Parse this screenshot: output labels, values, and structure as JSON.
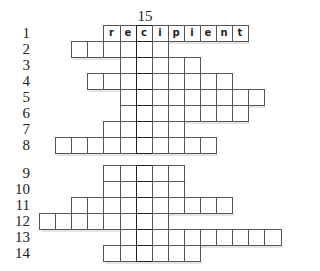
{
  "puzzle": {
    "key_column_label": "15",
    "key_column": 6,
    "origin_x": 39,
    "cell_size": 16.1,
    "rows": [
      {
        "label": "1",
        "top": 25,
        "start": 4,
        "end": 12,
        "letters": [
          "r",
          "e",
          "c",
          "i",
          "p",
          "i",
          "e",
          "n",
          "t"
        ]
      },
      {
        "label": "2",
        "top": 41,
        "start": 2,
        "end": 7
      },
      {
        "label": "3",
        "top": 57,
        "start": 5,
        "end": 9
      },
      {
        "label": "4",
        "top": 73,
        "start": 3,
        "end": 11
      },
      {
        "label": "5",
        "top": 89,
        "start": 5,
        "end": 13
      },
      {
        "label": "6",
        "top": 105,
        "start": 5,
        "end": 12
      },
      {
        "label": "7",
        "top": 121,
        "start": 4,
        "end": 8
      },
      {
        "label": "8",
        "top": 137,
        "start": 1,
        "end": 10
      },
      {
        "label": "9",
        "top": 165,
        "start": 4,
        "end": 8
      },
      {
        "label": "10",
        "top": 181,
        "start": 4,
        "end": 8
      },
      {
        "label": "11",
        "top": 197,
        "start": 2,
        "end": 11
      },
      {
        "label": "12",
        "top": 213,
        "start": 0,
        "end": 7
      },
      {
        "label": "13",
        "top": 229,
        "start": 5,
        "end": 14
      },
      {
        "label": "14",
        "top": 245,
        "start": 4,
        "end": 9
      }
    ]
  }
}
